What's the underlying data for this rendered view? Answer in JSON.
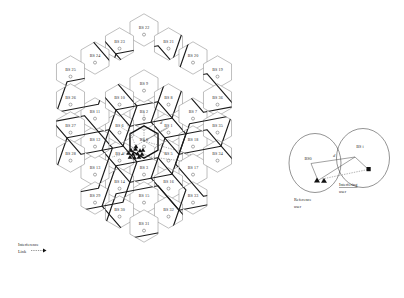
{
  "figure": {
    "type": "cellular-network-hexagon-layout"
  },
  "grid": {
    "center_label": "BS 0",
    "cells": [
      {
        "label": "BS 0",
        "cx": 144.0,
        "cy": 142.0,
        "ring": 0,
        "bold": true
      },
      {
        "label": "BS 2",
        "cx": 144.0,
        "cy": 114.0,
        "ring": 1,
        "bold": false
      },
      {
        "label": "BS 1",
        "cx": 168.5,
        "cy": 128.0,
        "ring": 1,
        "bold": false
      },
      {
        "label": "BS 5",
        "cx": 168.5,
        "cy": 156.0,
        "ring": 1,
        "bold": false
      },
      {
        "label": "BS 3",
        "cx": 144.0,
        "cy": 170.0,
        "ring": 1,
        "bold": false
      },
      {
        "label": "BS 4",
        "cx": 119.5,
        "cy": 156.0,
        "ring": 1,
        "bold": false
      },
      {
        "label": "BS 6",
        "cx": 119.5,
        "cy": 128.0,
        "ring": 1,
        "bold": false
      },
      {
        "label": "BS 9",
        "cx": 144.0,
        "cy": 86.0,
        "ring": 2,
        "bold": false
      },
      {
        "label": "BS 8",
        "cx": 168.5,
        "cy": 100.0,
        "ring": 2,
        "bold": false
      },
      {
        "label": "BS 7",
        "cx": 193.0,
        "cy": 114.0,
        "ring": 2,
        "bold": false
      },
      {
        "label": "BS 18",
        "cx": 193.0,
        "cy": 142.0,
        "ring": 2,
        "bold": false
      },
      {
        "label": "BS 17",
        "cx": 193.0,
        "cy": 170.0,
        "ring": 2,
        "bold": false
      },
      {
        "label": "BS 16",
        "cx": 168.5,
        "cy": 184.0,
        "ring": 2,
        "bold": false
      },
      {
        "label": "BS 15",
        "cx": 144.0,
        "cy": 198.0,
        "ring": 2,
        "bold": false
      },
      {
        "label": "BS 14",
        "cx": 119.5,
        "cy": 184.0,
        "ring": 2,
        "bold": false
      },
      {
        "label": "BS 13",
        "cx": 95.0,
        "cy": 170.0,
        "ring": 2,
        "bold": false
      },
      {
        "label": "BS 12",
        "cx": 95.0,
        "cy": 142.0,
        "ring": 2,
        "bold": false
      },
      {
        "label": "BS 11",
        "cx": 95.0,
        "cy": 114.0,
        "ring": 2,
        "bold": false
      },
      {
        "label": "BS 10",
        "cx": 119.5,
        "cy": 100.0,
        "ring": 2,
        "bold": false
      },
      {
        "label": "BS 22",
        "cx": 144.0,
        "cy": 30.0,
        "ring": 3,
        "bold": false
      },
      {
        "label": "BS 23",
        "cx": 119.5,
        "cy": 44.0,
        "ring": 3,
        "bold": false
      },
      {
        "label": "BS 21",
        "cx": 168.5,
        "cy": 44.0,
        "ring": 3,
        "bold": false
      },
      {
        "label": "BS 24",
        "cx": 95.0,
        "cy": 58.0,
        "ring": 3,
        "bold": false
      },
      {
        "label": "BS 20",
        "cx": 193.0,
        "cy": 58.0,
        "ring": 3,
        "bold": false
      },
      {
        "label": "BS 25",
        "cx": 70.5,
        "cy": 72.0,
        "ring": 3,
        "bold": false
      },
      {
        "label": "BS 19",
        "cx": 217.5,
        "cy": 72.0,
        "ring": 3,
        "bold": false
      },
      {
        "label": "BS 26",
        "cx": 70.5,
        "cy": 100.0,
        "ring": 3,
        "bold": false
      },
      {
        "label": "BS 36",
        "cx": 217.5,
        "cy": 100.0,
        "ring": 3,
        "bold": false
      },
      {
        "label": "BS 27",
        "cx": 70.5,
        "cy": 128.0,
        "ring": 3,
        "bold": false
      },
      {
        "label": "BS 35",
        "cx": 217.5,
        "cy": 128.0,
        "ring": 3,
        "bold": false
      },
      {
        "label": "BS 28",
        "cx": 70.5,
        "cy": 156.0,
        "ring": 3,
        "bold": false
      },
      {
        "label": "BS 34",
        "cx": 217.5,
        "cy": 156.0,
        "ring": 3,
        "bold": false
      },
      {
        "label": "BS 29",
        "cx": 95.0,
        "cy": 198.0,
        "ring": 3,
        "bold": false
      },
      {
        "label": "BS 33",
        "cx": 193.0,
        "cy": 198.0,
        "ring": 3,
        "bold": false
      },
      {
        "label": "BS 30",
        "cx": 119.5,
        "cy": 212.0,
        "ring": 3,
        "bold": false
      },
      {
        "label": "BS 32",
        "cx": 168.5,
        "cy": 212.0,
        "ring": 3,
        "bold": false
      },
      {
        "label": "BS 31",
        "cx": 144.0,
        "cy": 226.0,
        "ring": 3,
        "bold": false
      }
    ]
  },
  "annotations": {
    "interference_link_line1": "Interference",
    "interference_link_line2": "Link",
    "distance_symbol": "d"
  },
  "inset": {
    "bs0_label": "BS0",
    "bsi_label": "BS i",
    "distance_label": "d",
    "reference_user_line1": "Reference",
    "reference_user_line2": "user",
    "interfering_user_line1": "Interfering",
    "interfering_user_line2": "user"
  },
  "colors": {
    "cell_stroke_thin": "#8a8a8a",
    "cell_stroke_thick": "#1c1c1c",
    "text": "#2a2a2a",
    "background": "#ffffff",
    "marker": "#111111"
  }
}
